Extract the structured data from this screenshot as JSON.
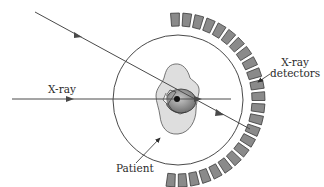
{
  "diagram": {
    "labels": {
      "xray": "X-ray",
      "detectors_line1": "X-ray",
      "detectors_line2": "detectors",
      "patient": "Patient"
    },
    "colors": {
      "line": "#4a4a4a",
      "detector_fill": "#8a8a8a",
      "detector_stroke": "#3a3a3a",
      "patient_fill": "#d9d9d9",
      "organ_fill": "#9a9a9a"
    },
    "gantry": {
      "cx": 178,
      "cy": 100,
      "r": 65
    },
    "detector_ring": {
      "inner_r": 74,
      "outer_r": 87,
      "count": 24,
      "start_deg": -92,
      "end_deg": 95
    }
  }
}
